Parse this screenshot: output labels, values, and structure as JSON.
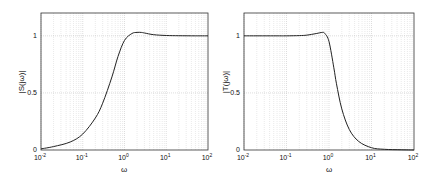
{
  "chart_data": [
    {
      "type": "line",
      "title": "",
      "xlabel": "ω",
      "ylabel": "|S(jω)|",
      "xscale": "log",
      "xlim": [
        0.01,
        100
      ],
      "ylim": [
        0,
        1.2
      ],
      "xticks": [
        "10^-2",
        "10^-1",
        "10^0",
        "10^1",
        "10^2"
      ],
      "yticks": [
        "0",
        "0.5",
        "1"
      ],
      "grid": true,
      "series": [
        {
          "name": "|S(jω)|",
          "x": [
            0.01,
            0.02,
            0.05,
            0.1,
            0.2,
            0.3,
            0.5,
            0.7,
            1.0,
            1.5,
            2.0,
            2.5,
            3.0,
            5.0,
            10,
            20,
            50,
            100
          ],
          "values": [
            0.01,
            0.03,
            0.07,
            0.14,
            0.28,
            0.41,
            0.64,
            0.82,
            0.96,
            1.02,
            1.03,
            1.03,
            1.025,
            1.01,
            1.003,
            1.001,
            1.0,
            1.0
          ]
        }
      ]
    },
    {
      "type": "line",
      "title": "",
      "xlabel": "ω",
      "ylabel": "|T(jω)|",
      "xscale": "log",
      "xlim": [
        0.01,
        100
      ],
      "ylim": [
        0,
        1.2
      ],
      "xticks": [
        "10^-2",
        "10^-1",
        "10^0",
        "10^1",
        "10^2"
      ],
      "yticks": [
        "0",
        "0.5",
        "1"
      ],
      "grid": true,
      "series": [
        {
          "name": "|T(jω)|",
          "x": [
            0.01,
            0.05,
            0.1,
            0.2,
            0.3,
            0.5,
            0.7,
            0.8,
            1.0,
            1.3,
            1.5,
            2.0,
            3.0,
            5.0,
            10,
            20,
            50,
            100
          ],
          "values": [
            1.0,
            1.0,
            1.0,
            1.002,
            1.006,
            1.02,
            1.03,
            1.02,
            0.95,
            0.72,
            0.58,
            0.36,
            0.18,
            0.075,
            0.02,
            0.006,
            0.002,
            0.0
          ]
        }
      ]
    }
  ],
  "left": {
    "ylabel": "|S(jω)|",
    "xlabel": "ω"
  },
  "right": {
    "ylabel": "|T(jω)|",
    "xlabel": "ω"
  },
  "ticks": {
    "y0": "0",
    "y05": "0.5",
    "y1": "1",
    "xbase": "10",
    "xexp": [
      "-2",
      "-1",
      "0",
      "1",
      "2"
    ]
  }
}
